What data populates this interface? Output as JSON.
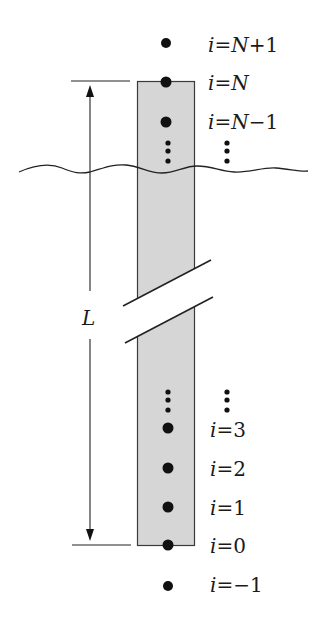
{
  "diagram": {
    "type": "finite-difference grid along a rod",
    "colors": {
      "rod_fill": "#d6d6d6",
      "rod_stroke": "#3a3a3a",
      "line": "#222222",
      "dot": "#111111",
      "text": "#1a1a1a"
    },
    "length_label": "L",
    "nodes": [
      {
        "index": "N+1",
        "var": "i",
        "eq": "=",
        "value_prefix": "N",
        "value_rest": "+1",
        "position": "outside-top"
      },
      {
        "index": "N",
        "var": "i",
        "eq": "=",
        "value_prefix": "N",
        "value_rest": "",
        "position": "top-boundary"
      },
      {
        "index": "N-1",
        "var": "i",
        "eq": "=",
        "value_prefix": "N",
        "value_rest": "−1",
        "position": "interior"
      },
      {
        "index": "3",
        "var": "i",
        "eq": "=",
        "value_prefix": "",
        "value_rest": "3",
        "position": "interior"
      },
      {
        "index": "2",
        "var": "i",
        "eq": "=",
        "value_prefix": "",
        "value_rest": "2",
        "position": "interior"
      },
      {
        "index": "1",
        "var": "i",
        "eq": "=",
        "value_prefix": "",
        "value_rest": "1",
        "position": "interior"
      },
      {
        "index": "0",
        "var": "i",
        "eq": "=",
        "value_prefix": "",
        "value_rest": "0",
        "position": "bottom-boundary"
      },
      {
        "index": "-1",
        "var": "i",
        "eq": "=",
        "value_prefix": "",
        "value_rest": "−1",
        "position": "outside-bottom"
      }
    ],
    "annotations": {
      "upper_ellipsis": "⋮",
      "lower_ellipsis": "⋮",
      "break_marks": "double slash break indicating omitted length",
      "wavy_line": "wavy horizontal cut line"
    }
  }
}
